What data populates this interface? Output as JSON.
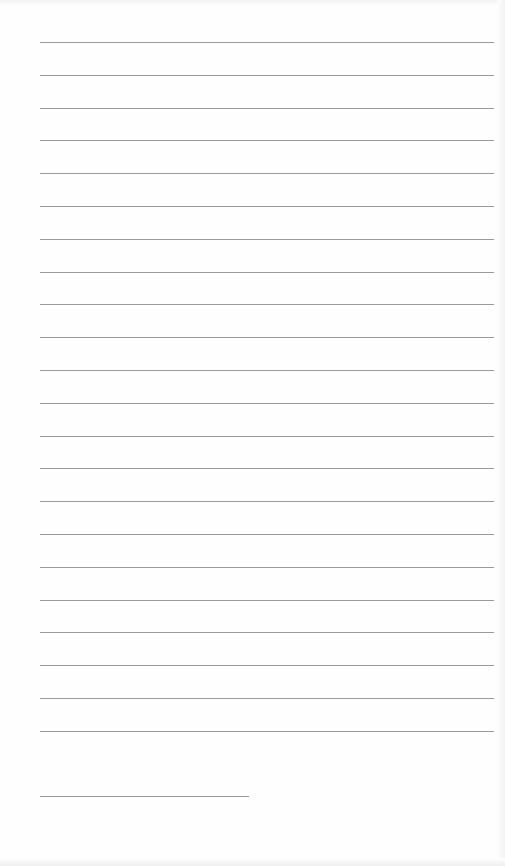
{
  "document": {
    "type": "lined-paper",
    "line_color": "#9a9a9a",
    "background": "#fefefe",
    "full_lines": 22,
    "short_lines": 1
  }
}
